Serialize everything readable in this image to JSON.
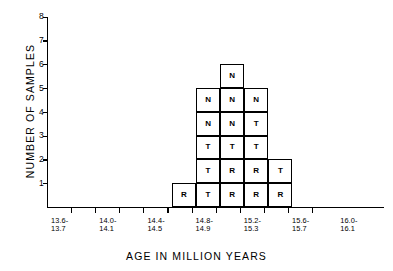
{
  "chart_data": {
    "type": "bar",
    "title": "",
    "xlabel": "AGE IN MILLION YEARS",
    "ylabel": "NUMBER OF SAMPLES",
    "ylim": [
      0,
      8
    ],
    "grid": false,
    "legend": "none",
    "y_ticks": [
      "8",
      "7",
      "6",
      "5",
      "4",
      "3",
      "2",
      "1"
    ],
    "y_tick_values": [
      8,
      7,
      6,
      5,
      4,
      3,
      2,
      1
    ],
    "categories": [
      "14.4-14.5",
      "14.8-14.9",
      "15.0-15.1",
      "15.2-15.3",
      "15.4-15.5"
    ],
    "values": [
      1,
      5,
      6,
      5,
      2
    ],
    "x_tick_labels": [
      {
        "line1": "13.6-",
        "line2": "13.7"
      },
      {
        "line1": "14.0-",
        "line2": "14.1"
      },
      {
        "line1": "14.4-",
        "line2": "14.5"
      },
      {
        "line1": "14.8-",
        "line2": "14.9"
      },
      {
        "line1": "15.2-",
        "line2": "15.3"
      },
      {
        "line1": "15.6-",
        "line2": "15.7"
      },
      {
        "line1": "16.0-",
        "line2": "16.1"
      }
    ],
    "cell_labels": [
      [
        "R"
      ],
      [
        "T",
        "T",
        "T",
        "N",
        "N"
      ],
      [
        "R",
        "R",
        "T",
        "N",
        "N",
        "N"
      ],
      [
        "R",
        "R",
        "T",
        "T",
        "N"
      ],
      [
        "R",
        "T"
      ]
    ],
    "annotation_legend": {
      "N": "N",
      "T": "T",
      "R": "R"
    },
    "colors": {
      "axis": "#000000",
      "bar_stroke": "#000000",
      "bar_fill": "#ffffff",
      "text": "#000000"
    }
  }
}
